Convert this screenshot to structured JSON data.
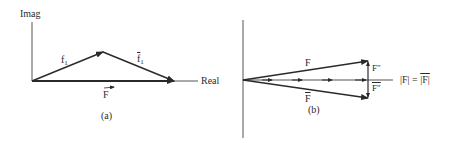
{
  "figure": {
    "panel_a": {
      "caption": "(a)",
      "axis_y_label": "Imag",
      "axis_x_label": "Real",
      "vectors": [
        {
          "name": "f",
          "subscript": "1",
          "conjugate": false
        },
        {
          "name": "f",
          "subscript": "1",
          "conjugate": true
        },
        {
          "name": "F",
          "arrow_over": true
        }
      ]
    },
    "panel_b": {
      "caption": "(b)",
      "upper_vector_label": "F",
      "lower_vector_label": "F",
      "upper_increment_label": "F″",
      "lower_increment_label": "F″",
      "equality_label": "|F| = |F|",
      "equality_lhs": "|F|",
      "equality_eq": "=",
      "equality_rhs": "|F|"
    },
    "colors": {
      "ink": "#2a2a2a",
      "background": "#ffffff"
    }
  }
}
